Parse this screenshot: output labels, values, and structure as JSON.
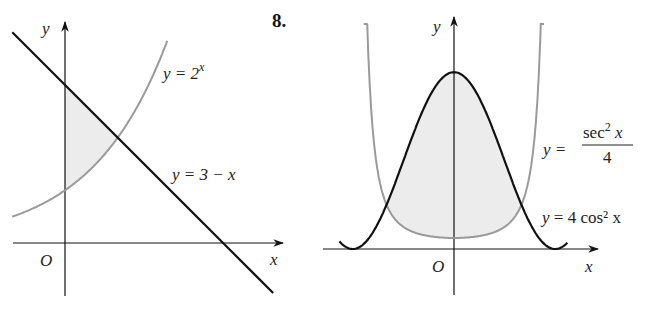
{
  "problem_number": "8.",
  "left_figure": {
    "axis_x_label": "x",
    "axis_y_label": "y",
    "origin_label": "O",
    "curves": [
      {
        "name": "exponential",
        "label_lhs": "y = 2",
        "label_sup": "x",
        "equation": "y = 2^x",
        "color": "#9a9a9a"
      },
      {
        "name": "line",
        "label": "y = 3 − x",
        "equation": "y = 3 - x",
        "color": "#111111"
      }
    ],
    "shaded_region": "between y=3-x (top) and y=2^x (bottom), from x=0 to x=1",
    "shade_color": "#ececec"
  },
  "right_figure": {
    "axis_x_label": "x",
    "axis_y_label": "y",
    "origin_label": "O",
    "curves": [
      {
        "name": "sec-squared",
        "label_lhs": "y =",
        "label_num": "sec",
        "label_num_sup": "2",
        "label_num_tail": " x",
        "label_den": "4",
        "equation": "y = sec^2(x)/4",
        "color": "#9a9a9a"
      },
      {
        "name": "cos-squared",
        "label_lhs": "y = 4 cos",
        "label_sup": "2",
        "label_tail": " x",
        "equation": "y = 4cos^2(x)",
        "color": "#111111"
      }
    ],
    "shaded_region": "between y=4cos^2 x (top) and y=sec^2 x/4 (bottom), from x=-pi/3 to x=pi/3",
    "shade_color": "#ececec"
  }
}
